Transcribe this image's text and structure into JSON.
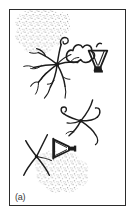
{
  "figure": {
    "panel_label": "(a)",
    "type": "scientific-line-drawing",
    "background_color": "#ffffff",
    "frame_color": "#2b2b2b",
    "ink_color": "#1c1c1c",
    "stipple_color": "#8d8d8d",
    "frame": {
      "x": 9,
      "y": 9,
      "width": 117,
      "height": 197
    },
    "elements": [
      {
        "name": "stipple-region-top-left",
        "kind": "stippled-area",
        "description": "irregular amoeboid stippled tissue patch, upper left",
        "approx_bounds": {
          "x": 8,
          "y": 5,
          "width": 62,
          "height": 50
        }
      },
      {
        "name": "stipple-region-bottom-center",
        "kind": "stippled-area",
        "description": "irregular amoeboid stippled tissue patch, lower center",
        "approx_bounds": {
          "x": 30,
          "y": 140,
          "width": 62,
          "height": 48
        }
      },
      {
        "name": "branching-cell-large",
        "kind": "branching-dendritic-cell",
        "description": "large multipolar branching cell with central soma and many fine processes",
        "approx_bounds": {
          "x": 12,
          "y": 30,
          "width": 75,
          "height": 70
        }
      },
      {
        "name": "lobed-outline-upper",
        "kind": "lobed-outline",
        "description": "scalloped multi-lobed outline right of the large branching cell",
        "approx_bounds": {
          "x": 60,
          "y": 30,
          "width": 32,
          "height": 28
        }
      },
      {
        "name": "funnel-shape-upper-right",
        "kind": "funnel-triangle",
        "description": "inverted funnel / triangular vessel outline with solid dark base",
        "approx_bounds": {
          "x": 80,
          "y": 42,
          "width": 26,
          "height": 28
        }
      },
      {
        "name": "branching-cell-middle",
        "kind": "branching-dendritic-cell",
        "description": "medium bipolar branching cell with curling processes, middle right",
        "approx_bounds": {
          "x": 58,
          "y": 92,
          "width": 48,
          "height": 40
        }
      },
      {
        "name": "branching-cell-lower",
        "kind": "branching-dendritic-cell",
        "description": "small X-shaped branching cell, lower left",
        "approx_bounds": {
          "x": 12,
          "y": 122,
          "width": 36,
          "height": 48
        }
      },
      {
        "name": "funnel-shape-lower",
        "kind": "funnel-triangle",
        "description": "triangular vessel outline pointing right with dark edge, lower center",
        "approx_bounds": {
          "x": 42,
          "y": 126,
          "width": 28,
          "height": 26
        }
      }
    ]
  }
}
